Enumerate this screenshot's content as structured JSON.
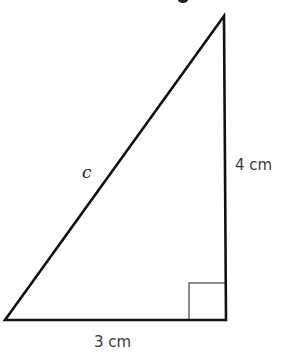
{
  "diagram": {
    "type": "right-triangle",
    "hypotenuse_label": "c",
    "vertical_side_label": "4 cm",
    "horizontal_side_label": "3 cm",
    "right_angle_marker": true,
    "colors": {
      "stroke": "#111111",
      "marker": "#555555",
      "text": "#3a3a3a"
    }
  }
}
